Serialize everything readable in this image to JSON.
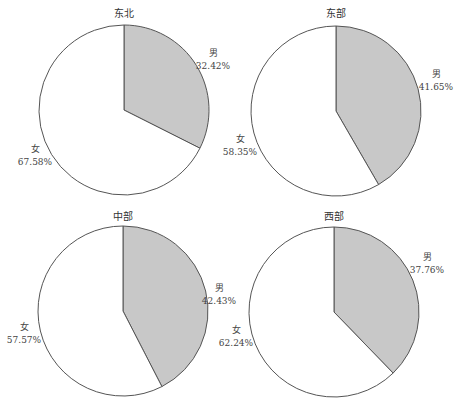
{
  "chart_data": [
    {
      "type": "pie",
      "title": "东北",
      "categories": [
        "男",
        "女"
      ],
      "values": [
        32.42,
        67.58
      ],
      "labels": [
        "32.42%",
        "67.58%"
      ],
      "colors": [
        "#c8c8c8",
        "#ffffff"
      ],
      "layout": {
        "cx": 124,
        "cy": 110,
        "r": 85,
        "title_y": 17,
        "label_pos": [
          [
            213,
            56,
            69
          ],
          [
            35,
            152,
            165
          ]
        ]
      }
    },
    {
      "type": "pie",
      "title": "东部",
      "categories": [
        "男",
        "女"
      ],
      "values": [
        41.65,
        58.35
      ],
      "labels": [
        "41.65%",
        "58.35%"
      ],
      "colors": [
        "#c8c8c8",
        "#ffffff"
      ],
      "layout": {
        "cx": 336,
        "cy": 111,
        "r": 85,
        "title_y": 17,
        "label_pos": [
          [
            436,
            77,
            90
          ],
          [
            240,
            142,
            155
          ]
        ]
      }
    },
    {
      "type": "pie",
      "title": "中部",
      "categories": [
        "男",
        "女"
      ],
      "values": [
        42.43,
        57.57
      ],
      "labels": [
        "42.43%",
        "57.57%"
      ],
      "colors": [
        "#c8c8c8",
        "#ffffff"
      ],
      "layout": {
        "cx": 123,
        "cy": 311,
        "r": 85,
        "title_y": 220,
        "label_pos": [
          [
            219,
            291,
            304
          ],
          [
            24,
            330,
            343
          ]
        ]
      }
    },
    {
      "type": "pie",
      "title": "西部",
      "categories": [
        "男",
        "女"
      ],
      "values": [
        37.76,
        62.24
      ],
      "labels": [
        "37.76%",
        "62.24%"
      ],
      "colors": [
        "#c8c8c8",
        "#ffffff"
      ],
      "layout": {
        "cx": 334,
        "cy": 312,
        "r": 85,
        "title_y": 220,
        "label_pos": [
          [
            427,
            260,
            273
          ],
          [
            236,
            333,
            346
          ]
        ]
      }
    }
  ]
}
